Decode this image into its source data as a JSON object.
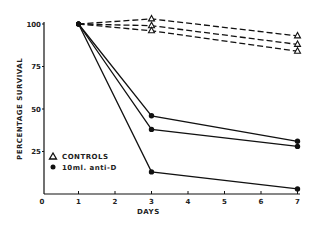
{
  "chart_data": {
    "type": "line",
    "title": "",
    "xlabel": "DAYS",
    "ylabel": "PERCENTAGE SURVIVAL",
    "xlim": [
      0,
      7
    ],
    "ylim": [
      0,
      100
    ],
    "x_ticks": [
      "0",
      "1",
      "2",
      "3",
      "4",
      "5",
      "6",
      "7"
    ],
    "y_ticks": [
      "25",
      "50",
      "75",
      "100"
    ],
    "grid": false,
    "legend": [
      {
        "marker": "triangle-open",
        "label": "CONTROLS"
      },
      {
        "marker": "circle-filled",
        "label": "10ml. anti-D"
      }
    ],
    "legend_position": "lower-left inside",
    "series": [
      {
        "name": "Control 1",
        "group": "CONTROLS",
        "style": "dashed",
        "x": [
          1,
          3,
          7
        ],
        "y": [
          100,
          103,
          93
        ]
      },
      {
        "name": "Control 2",
        "group": "CONTROLS",
        "style": "dashed",
        "x": [
          1,
          3,
          7
        ],
        "y": [
          100,
          99,
          88
        ]
      },
      {
        "name": "Control 3",
        "group": "CONTROLS",
        "style": "dashed",
        "x": [
          1,
          3,
          7
        ],
        "y": [
          100,
          96,
          84
        ]
      },
      {
        "name": "anti-D 1",
        "group": "10ml. anti-D",
        "style": "solid",
        "x": [
          1,
          3,
          7
        ],
        "y": [
          100,
          46,
          31
        ]
      },
      {
        "name": "anti-D 2",
        "group": "10ml. anti-D",
        "style": "solid",
        "x": [
          1,
          3,
          7
        ],
        "y": [
          100,
          38,
          28
        ]
      },
      {
        "name": "anti-D 3",
        "group": "10ml. anti-D",
        "style": "solid",
        "x": [
          1,
          3,
          7
        ],
        "y": [
          100,
          13,
          3
        ]
      }
    ]
  },
  "labels": {
    "xlabel": "DAYS",
    "ylabel": "PERCENTAGE SURVIVAL",
    "legend_controls": "CONTROLS",
    "legend_antid": "10ml. anti-D"
  }
}
